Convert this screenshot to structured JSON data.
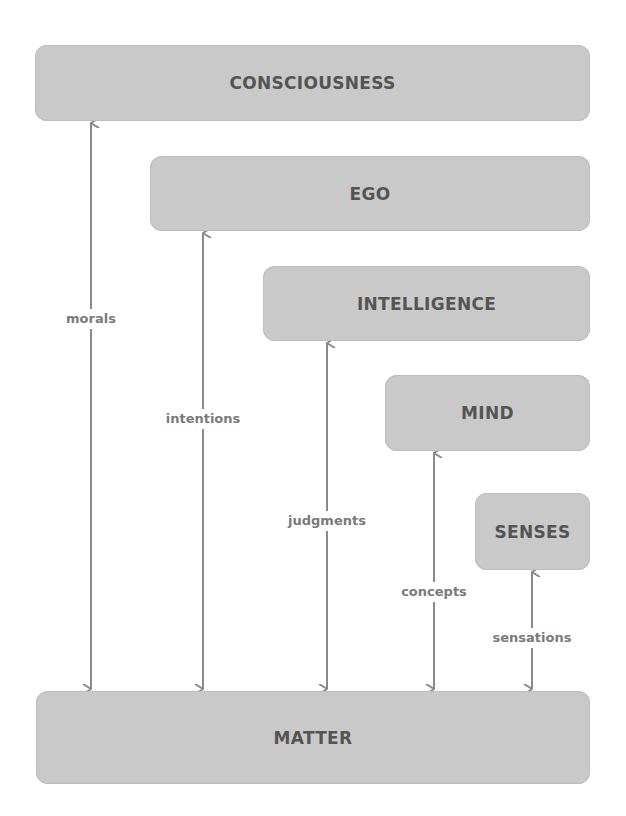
{
  "diagram": {
    "levels": [
      {
        "id": "consciousness",
        "label": "CONSCIOUSNESS"
      },
      {
        "id": "ego",
        "label": "EGO"
      },
      {
        "id": "intelligence",
        "label": "INTELLIGENCE"
      },
      {
        "id": "mind",
        "label": "MIND"
      },
      {
        "id": "senses",
        "label": "SENSES"
      },
      {
        "id": "matter",
        "label": "MATTER"
      }
    ],
    "connections": [
      {
        "from": "consciousness",
        "to": "matter",
        "label": "morals"
      },
      {
        "from": "ego",
        "to": "matter",
        "label": "intentions"
      },
      {
        "from": "intelligence",
        "to": "matter",
        "label": "judgments"
      },
      {
        "from": "mind",
        "to": "matter",
        "label": "concepts"
      },
      {
        "from": "senses",
        "to": "matter",
        "label": "sensations"
      }
    ],
    "colors": {
      "box_fill": "#c9c9c9",
      "box_text": "#545454",
      "arrow": "#8a8a8a",
      "label_text": "#7a7a7a"
    }
  }
}
